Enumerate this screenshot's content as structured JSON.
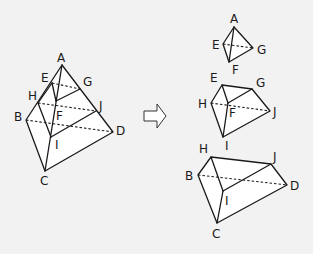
{
  "figures": {
    "original": {
      "name": "tetrahedron ABCD cut by planes EFG and HIJ",
      "labels": {
        "A": "A",
        "E": "E",
        "G": "G",
        "H": "H",
        "F": "F",
        "J": "J",
        "B": "B",
        "D": "D",
        "I": "I",
        "C": "C"
      }
    },
    "arrow": {
      "icon": "outline-right-arrow"
    },
    "pieces": [
      {
        "name": "top tetrahedron AEFG",
        "labels": {
          "A": "A",
          "E": "E",
          "G": "G",
          "F": "F"
        }
      },
      {
        "name": "middle frustum EFG-HIJ",
        "labels": {
          "E": "E",
          "G": "G",
          "H": "H",
          "F": "F",
          "J": "J",
          "I": "I"
        }
      },
      {
        "name": "bottom frustum HIJ-BCD",
        "labels": {
          "H": "H",
          "J": "J",
          "B": "B",
          "D": "D",
          "I": "I",
          "C": "C"
        }
      }
    ]
  },
  "colors": {
    "background": "#f2f2f2",
    "line": "#1a1a1a",
    "face": "#ffffff"
  }
}
